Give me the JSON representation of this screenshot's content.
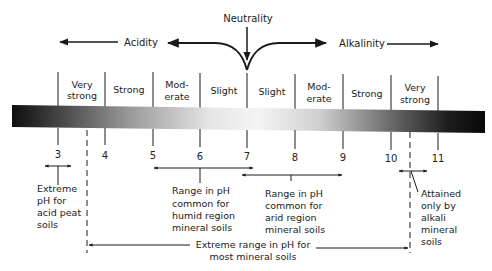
{
  "diagram": {
    "type": "ph-scale",
    "header": {
      "neutrality": "Neutrality",
      "acidity": "Acidity",
      "alkalinity": "Alkalinity"
    },
    "zones": [
      {
        "line1": "Very",
        "line2": "strong"
      },
      {
        "line1": "Strong",
        "line2": ""
      },
      {
        "line1": "Mod-",
        "line2": "erate"
      },
      {
        "line1": "Slight",
        "line2": ""
      },
      {
        "line1": "Slight",
        "line2": ""
      },
      {
        "line1": "Mod-",
        "line2": "erate"
      },
      {
        "line1": "Strong",
        "line2": ""
      },
      {
        "line1": "Very",
        "line2": "strong"
      }
    ],
    "ticks": [
      "3",
      "4",
      "5",
      "6",
      "7",
      "8",
      "9",
      "10",
      "11"
    ],
    "annotations": {
      "acid_peat": [
        "Extreme",
        "pH for",
        "acid peat",
        "soils"
      ],
      "humid": [
        "Range in pH",
        "common for",
        "humid region",
        "mineral soils"
      ],
      "arid": [
        "Range in pH",
        "common for",
        "arid region",
        "mineral soils"
      ],
      "alkali": [
        "Attained",
        "only by",
        "alkali",
        "mineral",
        "soils"
      ],
      "extreme_range": [
        "Extreme range in pH for",
        "most mineral soils"
      ]
    },
    "colors": {
      "bar_dark": "#111111",
      "bar_light": "#f2f2f2",
      "ink": "#1a1a1a"
    }
  }
}
